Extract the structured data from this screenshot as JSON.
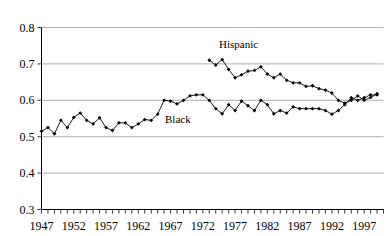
{
  "figure": {
    "clipped_top_text": "Lvi. co",
    "series_label_black": "Black",
    "series_label_hispanic": "Hispanic"
  },
  "chart_data": {
    "type": "line",
    "title": "",
    "xlabel": "",
    "ylabel": "",
    "xlim": [
      1947,
      2000
    ],
    "ylim": [
      0.3,
      0.8
    ],
    "yticks": [
      0.3,
      0.4,
      0.5,
      0.6,
      0.7,
      0.8
    ],
    "ytick_labels": [
      "0.3",
      "0.4",
      "0.5",
      "0.6",
      "0.7",
      "0.8"
    ],
    "xticks": [
      1947,
      1952,
      1957,
      1962,
      1967,
      1972,
      1977,
      1982,
      1987,
      1992,
      1997
    ],
    "xtick_labels": [
      "1947",
      "1952",
      "1957",
      "1962",
      "1967",
      "1972",
      "1977",
      "1982",
      "1987",
      "1992",
      "1997"
    ],
    "minor_xtick_interval": 1,
    "grid": "horizontal",
    "legend": "inline-annotations",
    "marker": "filled-diamond",
    "line_color": "#000000",
    "grid_color": "#9a9a9a",
    "series": [
      {
        "name": "Black",
        "x": [
          1947,
          1948,
          1949,
          1950,
          1951,
          1952,
          1953,
          1954,
          1955,
          1956,
          1957,
          1958,
          1959,
          1960,
          1961,
          1962,
          1963,
          1964,
          1965,
          1966,
          1967,
          1968,
          1969,
          1970,
          1971,
          1972,
          1973,
          1974,
          1975,
          1976,
          1977,
          1978,
          1979,
          1980,
          1981,
          1982,
          1983,
          1984,
          1985,
          1986,
          1987,
          1988,
          1989,
          1990,
          1991,
          1992,
          1993,
          1994,
          1995,
          1996,
          1997,
          1998,
          1999
        ],
        "values": [
          0.515,
          0.525,
          0.508,
          0.545,
          0.525,
          0.553,
          0.565,
          0.545,
          0.535,
          0.552,
          0.525,
          0.517,
          0.538,
          0.538,
          0.525,
          0.535,
          0.547,
          0.545,
          0.562,
          0.6,
          0.598,
          0.59,
          0.6,
          0.612,
          0.615,
          0.615,
          0.6,
          0.577,
          0.563,
          0.588,
          0.572,
          0.598,
          0.585,
          0.572,
          0.6,
          0.588,
          0.563,
          0.572,
          0.565,
          0.582,
          0.577,
          0.577,
          0.577,
          0.577,
          0.572,
          0.562,
          0.572,
          0.588,
          0.607,
          0.6,
          0.607,
          0.615,
          0.615
        ]
      },
      {
        "name": "Hispanic",
        "x": [
          1973,
          1974,
          1975,
          1976,
          1977,
          1978,
          1979,
          1980,
          1981,
          1982,
          1983,
          1984,
          1985,
          1986,
          1987,
          1988,
          1989,
          1990,
          1991,
          1992,
          1993,
          1994,
          1995,
          1996,
          1997,
          1998,
          1999
        ],
        "values": [
          0.71,
          0.697,
          0.712,
          0.685,
          0.662,
          0.67,
          0.68,
          0.682,
          0.692,
          0.672,
          0.662,
          0.672,
          0.655,
          0.648,
          0.648,
          0.638,
          0.64,
          0.632,
          0.628,
          0.62,
          0.6,
          0.592,
          0.6,
          0.612,
          0.6,
          0.608,
          0.618
        ]
      }
    ]
  }
}
